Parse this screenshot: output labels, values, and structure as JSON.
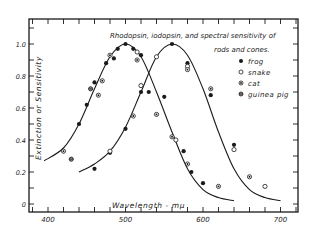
{
  "chart_data": {
    "type": "scatter",
    "title": "Rhodopsin, iodopsin, and spectral sensitivity of rods and cones.",
    "title_lines": [
      "Rhodopsin, iodopsin, and spectral sensitivity of",
      "rods and cones."
    ],
    "xlabel": "Wavelength - mμ",
    "ylabel": "Extinction or Sensitivity",
    "xlim": [
      375,
      720
    ],
    "ylim": [
      -0.05,
      1.15
    ],
    "x_ticks": [
      400,
      500,
      600,
      700
    ],
    "y_ticks": [
      0,
      0.2,
      0.4,
      0.6,
      0.8,
      1.0
    ],
    "y_tick_labels": [
      "0",
      "0.2",
      "0.4",
      "0.6",
      "0.8",
      "1.0"
    ],
    "grid": false,
    "legend_position": "upper right",
    "legend": [
      {
        "name": "frog",
        "marker": "filled"
      },
      {
        "name": "snake",
        "marker": "open"
      },
      {
        "name": "cat",
        "marker": "dotted"
      },
      {
        "name": "guinea pig",
        "marker": "crossed"
      }
    ],
    "curves": [
      {
        "name": "rhodopsin (rods)",
        "peak": 500,
        "x": [
          395,
          420,
          440,
          460,
          480,
          500,
          520,
          540,
          560,
          580,
          600,
          620,
          640
        ],
        "y": [
          0.27,
          0.35,
          0.5,
          0.72,
          0.92,
          1.0,
          0.92,
          0.7,
          0.45,
          0.22,
          0.09,
          0.04,
          0.02
        ]
      },
      {
        "name": "iodopsin (cones)",
        "peak": 560,
        "x": [
          440,
          460,
          480,
          500,
          520,
          540,
          560,
          580,
          600,
          620,
          640,
          660,
          680,
          700
        ],
        "y": [
          0.2,
          0.25,
          0.33,
          0.48,
          0.7,
          0.92,
          1.0,
          0.93,
          0.72,
          0.45,
          0.22,
          0.09,
          0.04,
          0.02
        ]
      }
    ],
    "series": [
      {
        "name": "frog",
        "points": [
          [
            440,
            0.5
          ],
          [
            450,
            0.62
          ],
          [
            460,
            0.76
          ],
          [
            475,
            0.88
          ],
          [
            485,
            0.91
          ],
          [
            490,
            0.97
          ],
          [
            500,
            1.0
          ],
          [
            510,
            0.97
          ],
          [
            520,
            0.93
          ],
          [
            530,
            0.7
          ],
          [
            550,
            0.67
          ],
          [
            575,
            0.33
          ],
          [
            585,
            0.2
          ],
          [
            600,
            0.13
          ],
          [
            460,
            0.22
          ],
          [
            480,
            0.32
          ],
          [
            500,
            0.47
          ],
          [
            520,
            0.7
          ],
          [
            560,
            1.0
          ],
          [
            580,
            0.88
          ],
          [
            610,
            0.68
          ],
          [
            640,
            0.37
          ]
        ]
      },
      {
        "name": "snake",
        "points": [
          [
            515,
            0.95
          ],
          [
            565,
            0.4
          ],
          [
            480,
            0.33
          ],
          [
            520,
            0.74
          ],
          [
            540,
            0.92
          ],
          [
            580,
            0.86
          ],
          [
            640,
            0.34
          ],
          [
            680,
            0.11
          ]
        ]
      },
      {
        "name": "cat",
        "points": [
          [
            420,
            0.33
          ],
          [
            465,
            0.68
          ],
          [
            470,
            0.77
          ],
          [
            480,
            0.93
          ],
          [
            515,
            0.9
          ],
          [
            540,
            0.56
          ],
          [
            560,
            0.42
          ],
          [
            580,
            0.25
          ],
          [
            620,
            0.11
          ],
          [
            510,
            0.55
          ],
          [
            580,
            0.84
          ],
          [
            610,
            0.72
          ],
          [
            660,
            0.17
          ]
        ]
      },
      {
        "name": "guinea pig",
        "points": [
          [
            430,
            0.28
          ],
          [
            455,
            0.72
          ]
        ]
      }
    ]
  }
}
